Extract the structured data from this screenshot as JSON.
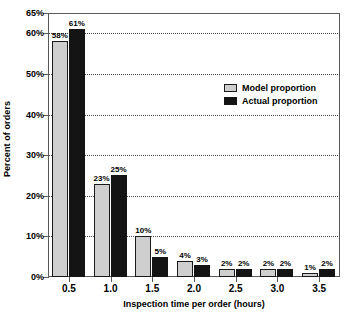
{
  "chart_data": {
    "type": "bar",
    "title": "",
    "xlabel": "Inspection time per order (hours)",
    "ylabel": "Percent of orders",
    "categories": [
      "0.5",
      "1.0",
      "1.5",
      "2.0",
      "2.5",
      "3.0",
      "3.5"
    ],
    "series": [
      {
        "name": "Model proportion",
        "color": "#cfcfcf",
        "values": [
          58,
          23,
          10,
          4,
          2,
          2,
          1
        ],
        "labels": [
          "58%",
          "23%",
          "10%",
          "4%",
          "2%",
          "2%",
          "1%"
        ]
      },
      {
        "name": "Actual proportion",
        "color": "#141414",
        "values": [
          61,
          25,
          5,
          3,
          2,
          2,
          2
        ],
        "labels": [
          "61%",
          "25%",
          "5%",
          "3%",
          "2%",
          "2%",
          "2%"
        ]
      }
    ],
    "ylim": [
      0,
      65
    ],
    "y_ticks": [
      0,
      10,
      20,
      30,
      40,
      50,
      60,
      65
    ],
    "y_tick_labels": [
      "0%",
      "10%",
      "20%",
      "30%",
      "40%",
      "50%",
      "60%",
      "65%"
    ],
    "grid": true,
    "grid_axis": "y",
    "legend_position": "upper-right-inside"
  }
}
